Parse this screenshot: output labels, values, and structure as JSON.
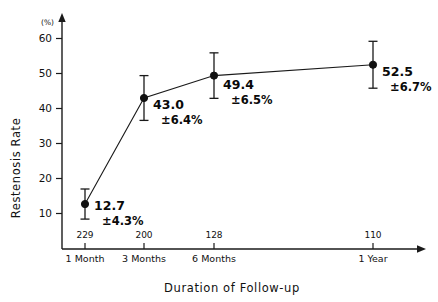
{
  "chart_data": {
    "type": "line",
    "title": "",
    "subtitle": "",
    "xlabel": "Duration of Follow-up",
    "ylabel": "Restenosis Rate",
    "yunit": "(%)",
    "categories": [
      "1 Month",
      "3 Months",
      "6 Months",
      "1 Year"
    ],
    "x_positions_months": [
      1,
      3,
      6,
      12
    ],
    "values": [
      12.7,
      43.0,
      49.4,
      52.5
    ],
    "errors": [
      4.3,
      6.4,
      6.5,
      6.7
    ],
    "sample_sizes": [
      229,
      200,
      128,
      110
    ],
    "point_labels": [
      {
        "value": "12.7",
        "error": "±4.3%"
      },
      {
        "value": "43.0",
        "error": "±6.4%"
      },
      {
        "value": "49.4",
        "error": "±6.5%"
      },
      {
        "value": "52.5",
        "error": "±6.7%"
      }
    ],
    "yticks": [
      10,
      20,
      30,
      40,
      50,
      60
    ],
    "ytick_labels": [
      "10",
      "20",
      "30",
      "40",
      "50",
      "60"
    ],
    "ylim": [
      0,
      65
    ],
    "grid": false,
    "legend": null,
    "legend_position": "none",
    "series": [
      {
        "name": "Restenosis Rate",
        "values": [
          12.7,
          43.0,
          49.4,
          52.5
        ],
        "errors": [
          4.3,
          6.4,
          6.5,
          6.7
        ],
        "marker": "filled-circle",
        "color": "#111111"
      }
    ],
    "axis_style": {
      "x_arrow": true,
      "y_arrow": true,
      "line_color": "#1a1a1a",
      "spines": [
        "left",
        "bottom"
      ]
    }
  },
  "colors": {
    "background": "#ffffff",
    "ink": "#111111",
    "axis": "#1a1a1a"
  }
}
